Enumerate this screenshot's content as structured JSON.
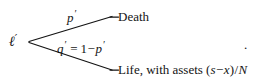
{
  "figure": {
    "type": "probability-tree",
    "background_color": "#ffffff",
    "ink_color": "#141414"
  },
  "root": {
    "symbol": "ℓ",
    "prime": "′",
    "x": 18,
    "y": 41
  },
  "branches": [
    {
      "name": "death-branch",
      "from": [
        27,
        42
      ],
      "to": [
        112,
        17
      ],
      "probability_symbol": "p",
      "probability_prime": "′",
      "outcome": "Death"
    },
    {
      "name": "life-branch",
      "from": [
        27,
        42
      ],
      "to": [
        112,
        70
      ],
      "probability_symbol": "q",
      "probability_prime": "′",
      "outcome": "Life, with assets (s−x)/N"
    }
  ],
  "labels": {
    "prob_death": {
      "var": "p",
      "prime": "′"
    },
    "prob_life_equation": {
      "lhs_var": "q",
      "lhs_prime": "′",
      "equals": "=",
      "one": "1",
      "minus": "−",
      "rhs_var": "p",
      "rhs_prime": "′",
      "full_text": "q′ = 1−p′"
    },
    "outcome_death": "Death",
    "outcome_life": {
      "prefix": "Life, with assets ",
      "open_paren": "(",
      "numerator_var_1": "s",
      "numerator_minus": "−",
      "numerator_var_2": "x",
      "close_paren": ")",
      "slash": "/",
      "denominator_var": "N",
      "full_text": "Life, with assets (s−x)/N"
    }
  },
  "trailing_period": "."
}
